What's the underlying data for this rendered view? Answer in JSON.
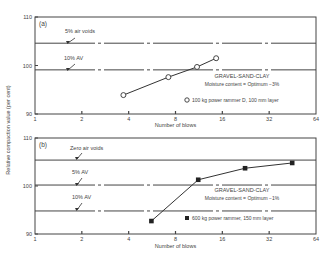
{
  "y_axis_label": "Relative compaction value (per cent)",
  "chart_data": [
    {
      "type": "line",
      "panel": "(a)",
      "xscale": "log2",
      "xlabel": "Number of blows",
      "ylabel": "Relative compaction value (per cent)",
      "xlim": [
        1,
        64
      ],
      "ylim": [
        90,
        110
      ],
      "x_ticks": [
        "1",
        "2",
        "4",
        "8",
        "16",
        "32",
        "64"
      ],
      "y_ticks": [
        "90",
        "100",
        "110"
      ],
      "reference_lines": [
        {
          "label": "5% air voids",
          "y": 104.6
        },
        {
          "label": "10% AV",
          "y": 99.1
        }
      ],
      "annotation_title": "GRAVEL-SAND-CLAY",
      "annotation_sub": "Moisture content = Optimum −3%",
      "series": [
        {
          "name": "100 kg power rammer D, 100 mm layer",
          "marker": "open-circle",
          "x": [
            3.7,
            7.2,
            11,
            14.6
          ],
          "y": [
            93.9,
            97.6,
            99.7,
            101.5
          ]
        }
      ]
    },
    {
      "type": "line",
      "panel": "(b)",
      "xscale": "log2",
      "xlabel": "Number of blows",
      "ylabel": "Relative compaction value (per cent)",
      "xlim": [
        1,
        64
      ],
      "ylim": [
        90,
        110
      ],
      "x_ticks": [
        "1",
        "2",
        "4",
        "8",
        "16",
        "32",
        "64"
      ],
      "y_ticks": [
        "90",
        "100",
        "110"
      ],
      "reference_lines": [
        {
          "label": "Zero air voids",
          "y": 105.4
        },
        {
          "label": "5% AV",
          "y": 100.2
        },
        {
          "label": "10% AV",
          "y": 94.8
        }
      ],
      "annotation_title": "GRAVEL-SAND-CLAY",
      "annotation_sub": "Moisture content = Optimum −1%",
      "series": [
        {
          "name": "600 kg power rammer, 150 mm layer",
          "marker": "filled-square",
          "x": [
            5.6,
            11.2,
            22.4,
            45
          ],
          "y": [
            92.7,
            101.3,
            103.7,
            104.8
          ]
        }
      ]
    }
  ]
}
